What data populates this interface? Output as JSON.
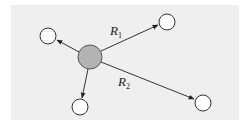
{
  "diagram": {
    "type": "hub-and-spoke",
    "background_color": "#efefef",
    "center_node": {
      "id": "center",
      "fill": "#b3b3b3",
      "cx": 90,
      "cy": 57,
      "r": 12
    },
    "outer_nodes": [
      {
        "id": "top-left",
        "cx": 48,
        "cy": 36,
        "r": 8,
        "fill": "#ffffff"
      },
      {
        "id": "top-right",
        "cx": 167,
        "cy": 22,
        "r": 8,
        "fill": "#ffffff"
      },
      {
        "id": "bottom",
        "cx": 80,
        "cy": 107,
        "r": 8,
        "fill": "#ffffff"
      },
      {
        "id": "bottom-right",
        "cx": 203,
        "cy": 103,
        "r": 8,
        "fill": "#ffffff"
      }
    ],
    "edges": [
      {
        "from": "center",
        "to": "top-left",
        "label": ""
      },
      {
        "from": "center",
        "to": "top-right",
        "label": "R1"
      },
      {
        "from": "center",
        "to": "bottom",
        "label": ""
      },
      {
        "from": "center",
        "to": "bottom-right",
        "label": "R2"
      }
    ],
    "labels": {
      "r1_main": "R",
      "r1_sub": "1",
      "r2_main": "R",
      "r2_sub": "2"
    }
  }
}
